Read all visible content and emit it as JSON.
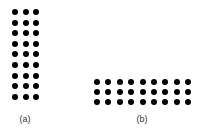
{
  "figures": [
    {
      "id": "a",
      "label": "(a)",
      "rows": 9,
      "cols": 3,
      "dot_count": 27
    },
    {
      "id": "b",
      "label": "(b)",
      "rows": 3,
      "cols": 9,
      "dot_count": 27
    }
  ],
  "colors": {
    "dot": "#000000",
    "background": "#ffffff",
    "label": "#333333"
  }
}
